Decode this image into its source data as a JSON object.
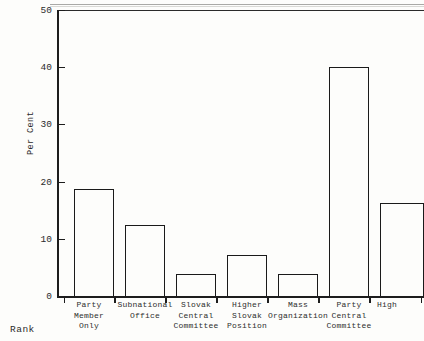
{
  "chart_data": {
    "type": "bar",
    "title": "",
    "subtitle": "",
    "xlabel": "Rank",
    "ylabel": "Per Cent",
    "ylim": [
      0,
      50
    ],
    "yticks": [
      0,
      10,
      20,
      30,
      40,
      50
    ],
    "ytick_labels": [
      "0",
      "10",
      "20",
      "30",
      "40",
      "50"
    ],
    "grid": false,
    "legend": null,
    "categories": [
      "Party\nMember\nOnly",
      "Subnational\nOffice",
      "Slovak\nCentral\nCommittee",
      "Higher\nSlovak\nPosition",
      "Mass\nOrganization",
      "Party\nCentral\nCommittee",
      "High"
    ],
    "values": [
      18.7,
      12.5,
      3.9,
      7.1,
      3.9,
      40.0,
      16.2
    ],
    "bar_style": {
      "fill": "none",
      "edge_color": "#1a1a1a",
      "edge_width": 1.5
    },
    "axis_color": "#1d1d1d",
    "background": "#fdfdfb"
  },
  "bar_geometry": [
    {
      "left": 17,
      "width": 40,
      "tick": 7,
      "label_left": -9,
      "label_width": 82
    },
    {
      "left": 68,
      "width": 40,
      "tick": 58,
      "label_left": 42,
      "label_width": 92
    },
    {
      "left": 119,
      "width": 40,
      "tick": 109,
      "label_left": 93,
      "label_width": 92
    },
    {
      "left": 170,
      "width": 40,
      "tick": 160,
      "label_left": 144,
      "label_width": 92
    },
    {
      "left": 221,
      "width": 40,
      "tick": 211,
      "label_left": 192,
      "label_width": 98
    },
    {
      "left": 272,
      "width": 40,
      "tick": 262,
      "label_left": 246,
      "label_width": 92
    },
    {
      "left": 323,
      "width": 44,
      "tick": 313,
      "label_left": 300,
      "label_width": 60
    }
  ],
  "extra_ticks": [
    364
  ]
}
